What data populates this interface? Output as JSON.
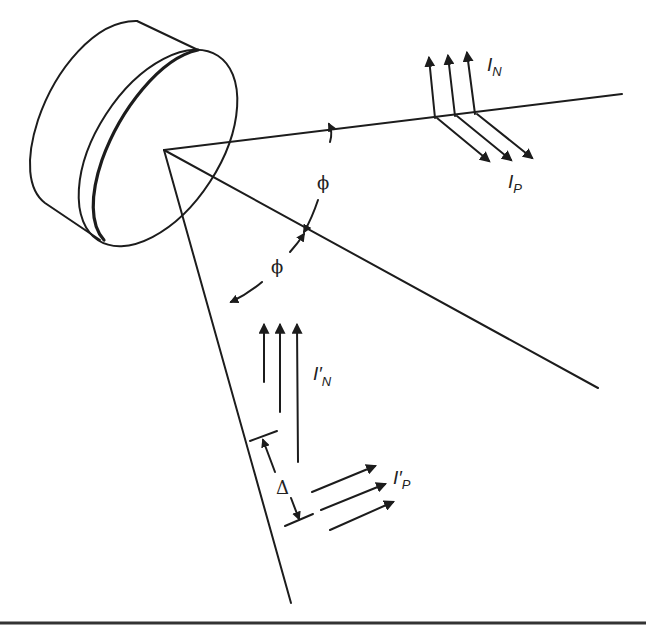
{
  "diagram": {
    "title": "",
    "colors": {
      "ink": "#1c1c1c",
      "background": "#ffffff"
    },
    "labels": {
      "incident_normal": {
        "main": "I",
        "sub": "N"
      },
      "incident_parallel": {
        "main": "I",
        "sub": "P"
      },
      "reflected_normal": {
        "main": "I′",
        "sub": "N"
      },
      "reflected_parallel": {
        "main": "I′",
        "sub": "P"
      },
      "angle_upper": "ϕ",
      "angle_lower": "ϕ",
      "offset": "Δ"
    },
    "components": [
      "cylinder-source",
      "incident-ray",
      "normal-line",
      "reflected-ray",
      "angle-arc",
      "offset-dimension"
    ]
  }
}
